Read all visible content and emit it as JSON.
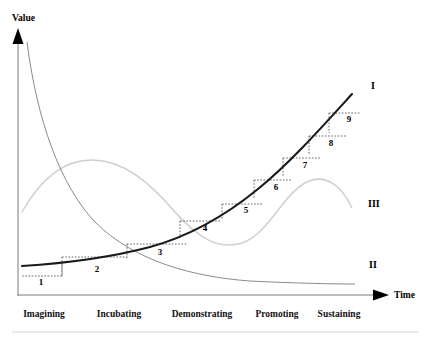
{
  "figure": {
    "axes": {
      "y_label": "Value",
      "x_label": "Time",
      "y_axis_name": "value-axis",
      "x_axis_name": "time-axis"
    },
    "phases": [
      {
        "label": "Imagining",
        "x": 44
      },
      {
        "label": "Incubating",
        "x": 119
      },
      {
        "label": "Demonstrating",
        "x": 202
      },
      {
        "label": "Promoting",
        "x": 277
      },
      {
        "label": "Sustaining",
        "x": 339
      }
    ],
    "curve_labels": [
      {
        "id": "I",
        "x": 371,
        "y": 89,
        "name": "curve-label-I"
      },
      {
        "id": "III",
        "x": 368,
        "y": 207,
        "name": "curve-label-III"
      },
      {
        "id": "II",
        "x": 369,
        "y": 268,
        "name": "curve-label-II"
      }
    ],
    "steps": [
      {
        "n": "1",
        "label_x": 41,
        "label_y": 285,
        "hx1": 22,
        "hx2": 62,
        "hy": 276,
        "vx": 62,
        "vy1": 276,
        "vy2": 264
      },
      {
        "n": "2",
        "label_x": 97,
        "label_y": 272,
        "hx1": 62,
        "hx2": 127,
        "hy": 257,
        "vx": 62,
        "vy1": 257,
        "vy2": 276
      },
      {
        "n": "3",
        "label_x": 160,
        "label_y": 255,
        "hx1": 127,
        "hx2": 187,
        "hy": 244,
        "vx": 127,
        "vy1": 244,
        "vy2": 258
      },
      {
        "n": "4",
        "label_x": 205,
        "label_y": 231,
        "hx1": 180,
        "hx2": 220,
        "hy": 221,
        "vx": 180,
        "vy1": 221,
        "vy2": 238
      },
      {
        "n": "5",
        "label_x": 246,
        "label_y": 213,
        "hx1": 222,
        "hx2": 262,
        "hy": 204,
        "vx": 222,
        "vy1": 204,
        "vy2": 220
      },
      {
        "n": "6",
        "label_x": 276,
        "label_y": 190,
        "hx1": 254,
        "hx2": 292,
        "hy": 180,
        "vx": 254,
        "vy1": 180,
        "vy2": 198
      },
      {
        "n": "7",
        "label_x": 305,
        "label_y": 168,
        "hx1": 283,
        "hx2": 320,
        "hy": 158,
        "vx": 283,
        "vy1": 158,
        "vy2": 176
      },
      {
        "n": "8",
        "label_x": 331,
        "label_y": 146,
        "hx1": 309,
        "hx2": 346,
        "hy": 136,
        "vx": 309,
        "vy1": 136,
        "vy2": 155
      },
      {
        "n": "9",
        "label_x": 349,
        "label_y": 122,
        "hx1": 329,
        "hx2": 360,
        "hy": 113,
        "vx": 329,
        "vy1": 113,
        "vy2": 133
      }
    ],
    "curves": {
      "main": {
        "name": "curve-I-growth",
        "path": "M 22 266 C 70 263, 112 257, 150 247 C 190 236, 225 216, 258 189 C 290 163, 322 127, 352 94"
      },
      "decay": {
        "name": "curve-II-decay",
        "path": "M 27 42 C 37 120, 60 185, 95 222 C 135 262, 195 277, 250 281 C 290 283, 330 284, 355 284"
      },
      "wave": {
        "name": "curve-III-wave",
        "path": "M 22 212 C 40 180, 62 160, 92 160 C 124 160, 150 183, 175 212 C 200 240, 220 250, 242 243 C 268 234, 282 196, 305 183 C 325 172, 342 186, 352 208"
      }
    },
    "footer_rule": {
      "name": "bottom-divider",
      "y": 332,
      "x1": 12,
      "x2": 418
    }
  }
}
